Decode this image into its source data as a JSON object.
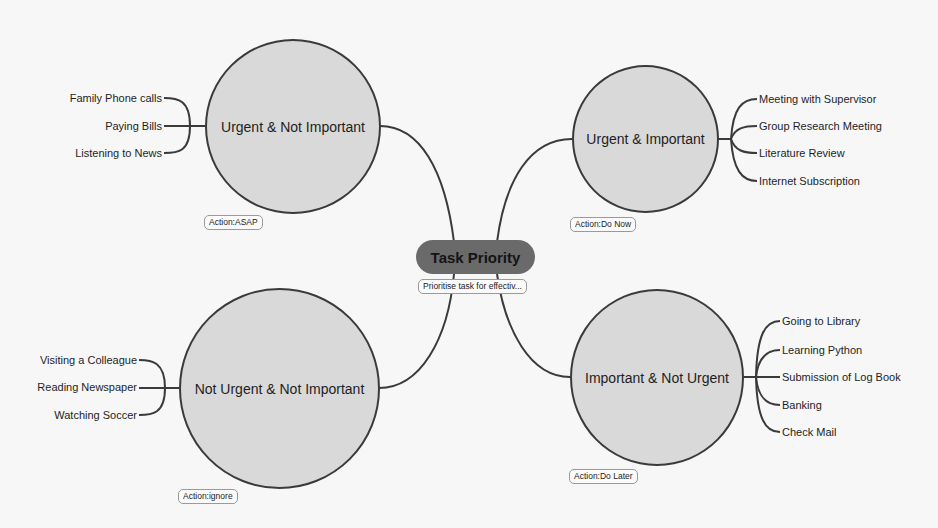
{
  "central": {
    "title": "Task Priority",
    "note": "Prioritise task for effectiv..."
  },
  "quadrants": [
    {
      "id": "urgent-not-important",
      "title": "Urgent & Not Important",
      "action": "Action:ASAP",
      "items": [
        "Family Phone calls",
        "Paying Bills",
        "Listening to News"
      ]
    },
    {
      "id": "urgent-important",
      "title": "Urgent & Important",
      "action": "Action:Do Now",
      "items": [
        "Meeting with Supervisor",
        "Group Research Meeting",
        "Literature Review",
        "Internet Subscription"
      ]
    },
    {
      "id": "not-urgent-not-important",
      "title": "Not Urgent & Not Important",
      "action": "Action:ignore",
      "items": [
        "Visiting a Colleague",
        "Reading Newspaper",
        "Watching Soccer"
      ]
    },
    {
      "id": "important-not-urgent",
      "title": "Important & Not Urgent",
      "action": "Action:Do Later",
      "items": [
        "Going to Library",
        "Learning Python",
        "Submission of Log Book",
        "Banking",
        "Check Mail"
      ]
    }
  ],
  "colors": {
    "background": "#f7f7f7",
    "circle_fill": "#d9d9d9",
    "stroke": "#3a3a3a",
    "central_fill": "#6a6a6a"
  }
}
